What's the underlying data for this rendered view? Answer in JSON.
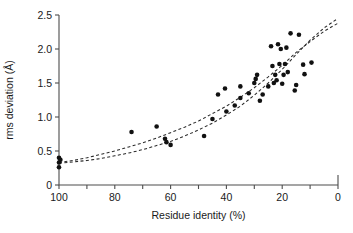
{
  "chart_data": {
    "type": "scatter",
    "title": "",
    "subtitle": "",
    "xlabel": "Residue identity (%)",
    "ylabel": "rms deviation (Å)",
    "xlim": [
      100,
      0
    ],
    "ylim": [
      0,
      2.5
    ],
    "x_axis_reversed": true,
    "grid": false,
    "legend": null,
    "legend_position": "none",
    "xticks": [
      100,
      90,
      80,
      70,
      60,
      50,
      40,
      30,
      20,
      10,
      0
    ],
    "xtick_labels": [
      "100",
      "",
      "80",
      "",
      "60",
      "",
      "40",
      "",
      "20",
      "",
      "0"
    ],
    "yticks": [
      0,
      0.5,
      1.0,
      1.5,
      2.0,
      2.5
    ],
    "ytick_labels": [
      "0",
      "0.5",
      "1.0",
      "1.5",
      "2.0",
      "2.5"
    ],
    "point_color": "#111111",
    "curve_color": "#2b2b2b",
    "axis_color": "#4d4d4d",
    "points": [
      {
        "x": 100,
        "y": 0.4
      },
      {
        "x": 100,
        "y": 0.33
      },
      {
        "x": 100,
        "y": 0.26
      },
      {
        "x": 99.5,
        "y": 0.37
      },
      {
        "x": 74,
        "y": 0.78
      },
      {
        "x": 65,
        "y": 0.86
      },
      {
        "x": 62,
        "y": 0.68
      },
      {
        "x": 61.5,
        "y": 0.63
      },
      {
        "x": 60,
        "y": 0.59
      },
      {
        "x": 48,
        "y": 0.72
      },
      {
        "x": 45,
        "y": 0.97
      },
      {
        "x": 43,
        "y": 1.33
      },
      {
        "x": 40.5,
        "y": 1.42
      },
      {
        "x": 40,
        "y": 1.08
      },
      {
        "x": 37,
        "y": 1.17
      },
      {
        "x": 35,
        "y": 1.45
      },
      {
        "x": 35,
        "y": 1.28
      },
      {
        "x": 32,
        "y": 1.35
      },
      {
        "x": 30,
        "y": 1.5
      },
      {
        "x": 29.5,
        "y": 1.56
      },
      {
        "x": 29,
        "y": 1.62
      },
      {
        "x": 28,
        "y": 1.24
      },
      {
        "x": 27,
        "y": 1.33
      },
      {
        "x": 25,
        "y": 1.45
      },
      {
        "x": 24,
        "y": 2.04
      },
      {
        "x": 23.5,
        "y": 1.75
      },
      {
        "x": 23,
        "y": 1.5
      },
      {
        "x": 22.5,
        "y": 1.62
      },
      {
        "x": 22,
        "y": 1.54
      },
      {
        "x": 21.5,
        "y": 2.07
      },
      {
        "x": 21,
        "y": 1.78
      },
      {
        "x": 20.5,
        "y": 2.0
      },
      {
        "x": 20,
        "y": 1.49
      },
      {
        "x": 19.5,
        "y": 1.62
      },
      {
        "x": 19,
        "y": 1.78
      },
      {
        "x": 18.5,
        "y": 2.02
      },
      {
        "x": 18,
        "y": 1.66
      },
      {
        "x": 17,
        "y": 2.23
      },
      {
        "x": 15.5,
        "y": 1.39
      },
      {
        "x": 15,
        "y": 1.47
      },
      {
        "x": 14,
        "y": 2.21
      },
      {
        "x": 12.5,
        "y": 1.77
      },
      {
        "x": 12,
        "y": 1.63
      },
      {
        "x": 9.5,
        "y": 1.8
      }
    ],
    "series": [
      {
        "name": "fit-curve-upper",
        "type": "line",
        "style": "dashed",
        "points": [
          {
            "x": 100,
            "y": 0.33
          },
          {
            "x": 95,
            "y": 0.36
          },
          {
            "x": 90,
            "y": 0.4
          },
          {
            "x": 85,
            "y": 0.45
          },
          {
            "x": 80,
            "y": 0.5
          },
          {
            "x": 75,
            "y": 0.56
          },
          {
            "x": 70,
            "y": 0.62
          },
          {
            "x": 65,
            "y": 0.69
          },
          {
            "x": 60,
            "y": 0.77
          },
          {
            "x": 55,
            "y": 0.85
          },
          {
            "x": 50,
            "y": 0.94
          },
          {
            "x": 45,
            "y": 1.05
          },
          {
            "x": 40,
            "y": 1.16
          },
          {
            "x": 35,
            "y": 1.29
          },
          {
            "x": 30,
            "y": 1.43
          },
          {
            "x": 25,
            "y": 1.59
          },
          {
            "x": 20,
            "y": 1.76
          },
          {
            "x": 15,
            "y": 1.95
          },
          {
            "x": 10,
            "y": 2.11
          },
          {
            "x": 5,
            "y": 2.26
          },
          {
            "x": 0,
            "y": 2.38
          }
        ]
      },
      {
        "name": "fit-curve-lower",
        "type": "line",
        "style": "dashed",
        "points": [
          {
            "x": 100,
            "y": 0.32
          },
          {
            "x": 95,
            "y": 0.34
          },
          {
            "x": 90,
            "y": 0.36
          },
          {
            "x": 85,
            "y": 0.39
          },
          {
            "x": 80,
            "y": 0.43
          },
          {
            "x": 75,
            "y": 0.47
          },
          {
            "x": 70,
            "y": 0.52
          },
          {
            "x": 65,
            "y": 0.58
          },
          {
            "x": 60,
            "y": 0.64
          },
          {
            "x": 55,
            "y": 0.72
          },
          {
            "x": 50,
            "y": 0.81
          },
          {
            "x": 45,
            "y": 0.91
          },
          {
            "x": 40,
            "y": 1.03
          },
          {
            "x": 35,
            "y": 1.16
          },
          {
            "x": 30,
            "y": 1.32
          },
          {
            "x": 25,
            "y": 1.5
          },
          {
            "x": 20,
            "y": 1.7
          },
          {
            "x": 15,
            "y": 1.92
          },
          {
            "x": 10,
            "y": 2.13
          },
          {
            "x": 5,
            "y": 2.31
          },
          {
            "x": 0,
            "y": 2.45
          }
        ]
      }
    ]
  }
}
